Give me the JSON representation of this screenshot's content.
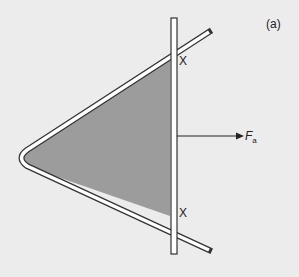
{
  "figure": {
    "panel_label": "(a)",
    "crossing_labels": [
      "X",
      "X"
    ],
    "force_label": {
      "symbol": "F",
      "subscript": "a"
    },
    "colors": {
      "background": "#ececec",
      "film_fill": "#9a9a9a",
      "outline": "#333333",
      "rail_fill": "#ffffff"
    }
  }
}
